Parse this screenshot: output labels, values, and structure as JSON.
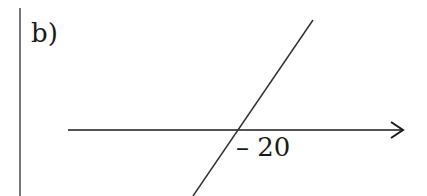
{
  "figure": {
    "part_label": "b)",
    "intercept_label": "– 20",
    "colors": {
      "ink": "#1a1a1a",
      "border": "#444444",
      "background": "#ffffff"
    },
    "elements": {
      "left_border": {
        "x1": 20,
        "y1": 8,
        "x2": 20,
        "y2": 196
      },
      "x_axis": {
        "x1": 68,
        "y1": 130,
        "x2": 403,
        "y2": 130,
        "arrow": "open-chevron"
      },
      "line": {
        "x1": 313,
        "y1": 20,
        "x2": 193,
        "y2": 196,
        "slope": "positive"
      }
    }
  }
}
